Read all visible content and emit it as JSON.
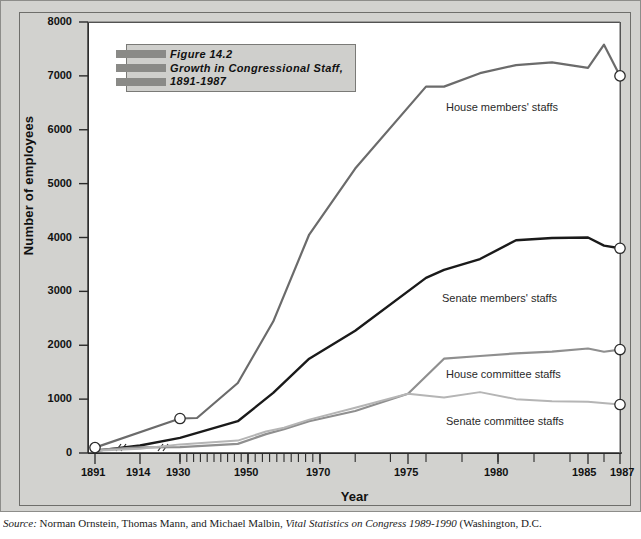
{
  "figure": {
    "number_label": "Figure 14.2",
    "title_line2": "Growth in Congressional Staff,",
    "title_line3": "1891-1987"
  },
  "source": {
    "prefix": "Source:",
    "authors": "Norman Ornstein, Thomas Mann, and Michael Malbin,",
    "title": "Vital Statistics on Congress 1989-1990",
    "publisher": "(Washington, D.C."
  },
  "axes": {
    "y_title": "Number of employees",
    "x_title": "Year",
    "y_ticks": [
      "0",
      "1000",
      "2000",
      "3000",
      "4000",
      "5000",
      "6000",
      "7000",
      "8000"
    ],
    "x_ticks": [
      "1891",
      "1914",
      "1930",
      "1950",
      "1970",
      "1975",
      "1980",
      "1985",
      "1987"
    ]
  },
  "series_labels": {
    "house_members": "House members' staffs",
    "senate_members": "Senate members' staffs",
    "house_committee": "House committee staffs",
    "senate_committee": "Senate committee staffs"
  },
  "colors": {
    "house_members": "#6b6b6b",
    "senate_members": "#1a1a1a",
    "house_committee": "#8f8f8f",
    "senate_committee": "#b5b5b5",
    "frame": "#d2d2cf",
    "canvas": "#ffffff",
    "axis": "#2a2a2a"
  },
  "chart_data": {
    "type": "line",
    "title": "Figure 14.2 Growth in Congressional Staff, 1891-1987",
    "xlabel": "Year",
    "ylabel": "Number of employees",
    "ylim": [
      0,
      8000
    ],
    "grid": false,
    "legend": "inline-annotations",
    "axis_breaks": [
      "between 1891 and 1914",
      "between 1914 and 1930"
    ],
    "x_tick_values": [
      1891,
      1914,
      1930,
      1950,
      1970,
      1975,
      1980,
      1985,
      1987
    ],
    "y_tick_values": [
      0,
      1000,
      2000,
      3000,
      4000,
      5000,
      6000,
      7000,
      8000
    ],
    "endpoint_markers": "open circles at 1930 start of House members and at 1987 for all four series",
    "series": [
      {
        "name": "House members' staffs",
        "color": "#6b6b6b",
        "x": [
          1891,
          1930,
          1935,
          1947,
          1957,
          1967,
          1972,
          1976,
          1977,
          1979,
          1981,
          1983,
          1985,
          1986,
          1987
        ],
        "values": [
          100,
          640,
          650,
          1300,
          2440,
          4055,
          5280,
          6800,
          6800,
          7050,
          7200,
          7250,
          7150,
          7580,
          7000
        ]
      },
      {
        "name": "Senate members' staffs",
        "color": "#1a1a1a",
        "x": [
          1891,
          1914,
          1930,
          1947,
          1957,
          1967,
          1972,
          1976,
          1977,
          1979,
          1981,
          1983,
          1985,
          1986,
          1987
        ],
        "values": [
          40,
          140,
          280,
          590,
          1115,
          1750,
          2270,
          3250,
          3400,
          3600,
          3950,
          3990,
          4000,
          3850,
          3800
        ]
      },
      {
        "name": "House committee staffs",
        "color": "#8f8f8f",
        "x": [
          1891,
          1914,
          1930,
          1947,
          1955,
          1960,
          1967,
          1972,
          1975,
          1977,
          1979,
          1981,
          1983,
          1985,
          1986,
          1987
        ],
        "values": [
          60,
          105,
          110,
          170,
          350,
          440,
          590,
          780,
          1100,
          1750,
          1800,
          1850,
          1880,
          1940,
          1880,
          1920
        ]
      },
      {
        "name": "Senate committee staffs",
        "color": "#b5b5b5",
        "x": [
          1891,
          1914,
          1930,
          1947,
          1955,
          1960,
          1967,
          1972,
          1975,
          1977,
          1979,
          1981,
          1983,
          1985,
          1987
        ],
        "values": [
          40,
          80,
          160,
          230,
          400,
          470,
          620,
          840,
          1100,
          1030,
          1130,
          1000,
          960,
          950,
          900
        ]
      }
    ]
  }
}
